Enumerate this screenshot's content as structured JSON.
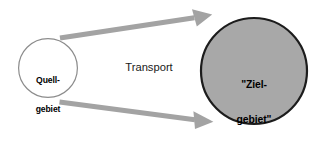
{
  "diagram": {
    "background_color": "#ffffff",
    "width": 324,
    "height": 143,
    "nodes": [
      {
        "id": "source",
        "name": "source-circle",
        "shape": "circle",
        "label_line1": "Quell-",
        "label_line2": "gebiet",
        "fill": "#ffffff",
        "stroke": "#8c8c8c",
        "stroke_width": 1.2,
        "cx": 48,
        "cy": 68,
        "r": 30
      },
      {
        "id": "target",
        "name": "target-circle",
        "shape": "circle",
        "label_line1": "\"Ziel-",
        "label_line2": "gebiet\"",
        "fill": "#a8a8a8",
        "stroke": "#1c1c1c",
        "stroke_width": 2.2,
        "cx": 254,
        "cy": 71,
        "r": 54
      }
    ],
    "edges": [
      {
        "id": "upper-arrow",
        "name": "transport-arrow-upper",
        "from": "source",
        "to": "target",
        "color": "#a3a3a3",
        "shaft_width": 5,
        "x1": 60,
        "y1": 38,
        "x2": 212,
        "y2": 15
      },
      {
        "id": "lower-arrow",
        "name": "transport-arrow-lower",
        "from": "source",
        "to": "target",
        "color": "#a3a3a3",
        "shaft_width": 5,
        "x1": 60,
        "y1": 102,
        "x2": 213,
        "y2": 122
      }
    ],
    "edge_label": {
      "text": "Transport",
      "color": "#1a1a1a"
    }
  }
}
